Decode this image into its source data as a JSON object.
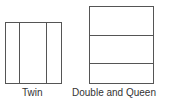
{
  "diagram": {
    "title": "",
    "figures": [
      {
        "id": "twin",
        "label": "Twin",
        "orientation": "vertical-split",
        "sections": 3
      },
      {
        "id": "double-queen",
        "label": "Double and Queen",
        "orientation": "horizontal-split",
        "sections": 3
      }
    ],
    "colors": {
      "line": "#555555",
      "text": "#333333",
      "background": "#ffffff"
    }
  }
}
